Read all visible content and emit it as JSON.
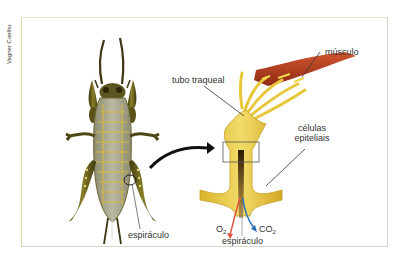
{
  "credit": "Vagner Coelho",
  "labels": {
    "musculo": "músculo",
    "tubo_traqueal": "tubo traqueal",
    "celulas_line1": "células",
    "celulas_line2": "epiteliais",
    "espiraculo_insect": "espiráculo",
    "espiraculo_detail": "espiráculo",
    "o2_main": "O",
    "o2_sub": "2",
    "co2_main": "CO",
    "co2_sub": "2"
  },
  "colors": {
    "trachea": "#e8c63a",
    "muscle": "#b23a1e",
    "o2_arrow": "#e0543c",
    "co2_arrow": "#2f6fb5",
    "insect_body": "#a9a88f",
    "insect_dark": "#4d4a1e"
  }
}
